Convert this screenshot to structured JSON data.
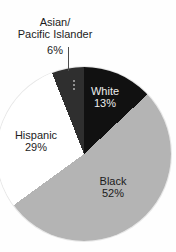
{
  "chart_data": {
    "type": "pie",
    "title": "",
    "units": "percent",
    "total": 100,
    "start_angle_deg": 0,
    "direction": "clockwise",
    "legend": "none",
    "slices": [
      {
        "name": "White",
        "value": 13,
        "pct_label": "13%",
        "color": "#111111",
        "label_position": "inside",
        "label_color": "#ededed"
      },
      {
        "name": "Black",
        "value": 52,
        "pct_label": "52%",
        "color": "#b4b4b4",
        "label_position": "inside",
        "label_color": "#1b1b1b"
      },
      {
        "name": "Hispanic",
        "value": 29,
        "pct_label": "29%",
        "color": "#ffffff",
        "label_position": "outside",
        "label_color": "#1c1c1c"
      },
      {
        "name": "Asian/Pacific Islander",
        "name_lines": [
          "Asian/",
          "Pacific Islander"
        ],
        "value": 6,
        "pct_label": "6%",
        "color": "#2f2f2f",
        "label_position": "outside",
        "label_color": "#1c1c1c",
        "leader_line": true
      }
    ],
    "colors": {
      "background": "#fefefe",
      "outline": "rgba(0,0,0,0.09)",
      "leader_line": "#4d4d4d"
    }
  }
}
